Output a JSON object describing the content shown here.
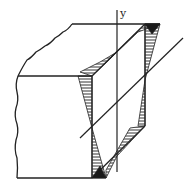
{
  "diagram": {
    "labels": {
      "y_axis": "y"
    },
    "colors": {
      "line": "#222222",
      "hatch": "#333333",
      "dark_fill": "#1a1a1a",
      "background": "#ffffff"
    }
  }
}
